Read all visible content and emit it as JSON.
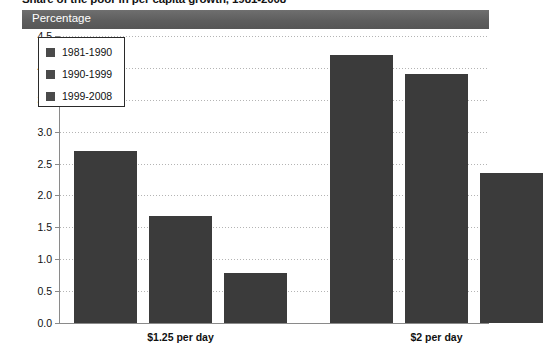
{
  "title": "Share of the poor in per capita growth, 1981-2008",
  "header": {
    "label": "Percentage"
  },
  "legend": {
    "items": [
      {
        "label": "1981-1990",
        "color": "#4a4a4a"
      },
      {
        "label": "1990-1999",
        "color": "#4a4a4a"
      },
      {
        "label": "1999-2008",
        "color": "#4a4a4a"
      }
    ]
  },
  "axis": {
    "y_ticks": [
      "0.0",
      "0.5",
      "1.0",
      "1.5",
      "2.0",
      "2.5",
      "3.0",
      "3.5",
      "4.0",
      "4.5"
    ],
    "x_labels": [
      "$1.25 per day",
      "$2 per day"
    ]
  },
  "chart_data": {
    "type": "bar",
    "title": "Share of the poor in per capita growth, 1981-2008",
    "xlabel": "",
    "ylabel": "Percentage",
    "ylim": [
      0,
      4.5
    ],
    "ytick_step": 0.5,
    "grid": true,
    "legend_position": "top-left",
    "categories": [
      "$1.25 per day",
      "$2 per day"
    ],
    "series": [
      {
        "name": "1981-1990",
        "color": "#3b3b3b",
        "values": [
          2.7,
          4.2
        ]
      },
      {
        "name": "1990-1999",
        "color": "#3b3b3b",
        "values": [
          1.68,
          3.9
        ]
      },
      {
        "name": "1999-2008",
        "color": "#3b3b3b",
        "values": [
          0.78,
          2.35
        ]
      }
    ]
  }
}
